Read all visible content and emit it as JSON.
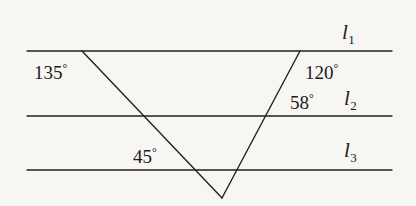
{
  "figure": {
    "type": "geometry-diagram",
    "background_color": "#f7f6f3",
    "stroke_color": "#222222",
    "text_color": "#1b1b1b"
  },
  "parallel_lines": [
    {
      "id": "l1",
      "label": "l",
      "subscript": "1",
      "y": 51,
      "x_start": 27,
      "x_end": 392
    },
    {
      "id": "l2",
      "label": "l",
      "subscript": "2",
      "y": 116,
      "x_start": 27,
      "x_end": 392
    },
    {
      "id": "l3",
      "label": "l",
      "subscript": "3",
      "y": 170,
      "x_start": 27,
      "x_end": 392
    }
  ],
  "transversals": [
    {
      "id": "left-leg",
      "from": {
        "x": 82,
        "y": 51
      },
      "to": {
        "x": 222,
        "y": 198
      }
    },
    {
      "id": "right-leg",
      "from": {
        "x": 300,
        "y": 51
      },
      "to": {
        "x": 222,
        "y": 198
      }
    }
  ],
  "vertices": {
    "left_top": {
      "x": 82,
      "y": 51
    },
    "right_top": {
      "x": 300,
      "y": 51
    },
    "apex": {
      "x": 222,
      "y": 198
    }
  },
  "angles": [
    {
      "id": "angle-135",
      "value": "135",
      "degree_symbol": "°",
      "at_line": "l1",
      "side": "left"
    },
    {
      "id": "angle-120",
      "value": "120",
      "degree_symbol": "°",
      "at_line": "l1",
      "side": "right"
    },
    {
      "id": "angle-58",
      "value": "58",
      "degree_symbol": "°",
      "at_line": "l2",
      "side": "right"
    },
    {
      "id": "angle-45",
      "value": "45",
      "degree_symbol": "°",
      "at_line": "l3",
      "side": "left"
    }
  ]
}
